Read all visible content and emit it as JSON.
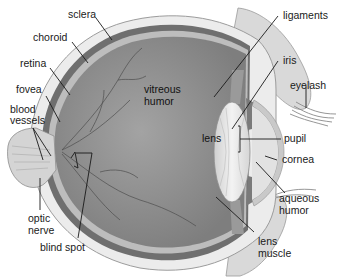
{
  "diagram": {
    "labels": {
      "sclera": "sclera",
      "choroid": "choroid",
      "retina": "retina",
      "fovea": "fovea",
      "blood_vessels_1": "blood",
      "blood_vessels_2": "vessels",
      "vitreous_1": "vitreous",
      "vitreous_2": "humor",
      "optic_1": "optic",
      "optic_2": "nerve",
      "blind_spot": "blind spot",
      "ligaments": "ligaments",
      "iris": "iris",
      "eyelash": "eyelash",
      "lens": "lens",
      "pupil": "pupil",
      "cornea": "cornea",
      "aqueous_1": "aqueous",
      "aqueous_2": "humor",
      "lens_muscle_1": "lens",
      "lens_muscle_2": "muscle"
    },
    "colors": {
      "vitreous": "#8f8f8f",
      "sclera": "#e6e6e6",
      "choroid": "#6e6e6e",
      "lens": "#e2e2e2",
      "leader": "#1a1a1a"
    }
  }
}
